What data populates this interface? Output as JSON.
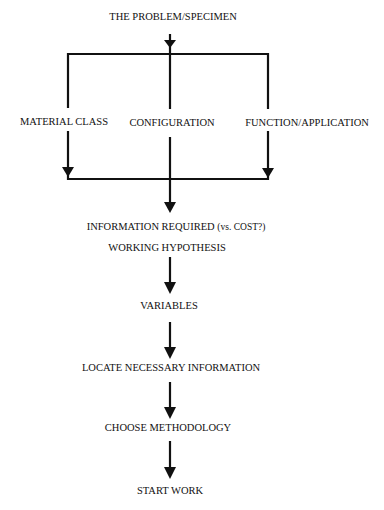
{
  "diagram": {
    "type": "flowchart",
    "colors": {
      "background": "#ffffff",
      "line": "#111111",
      "text": "#111111"
    },
    "nodes": [
      {
        "id": "problem",
        "label": "THE PROBLEM/SPECIMEN"
      },
      {
        "id": "material",
        "label": "MATERIAL CLASS"
      },
      {
        "id": "configuration",
        "label": "CONFIGURATION"
      },
      {
        "id": "function",
        "label": "FUNCTION/APPLICATION"
      },
      {
        "id": "info",
        "label": "INFORMATION REQUIRED",
        "note": "(vs. COST?)"
      },
      {
        "id": "hypothesis",
        "label": "WORKING HYPOTHESIS"
      },
      {
        "id": "variables",
        "label": "VARIABLES"
      },
      {
        "id": "locate",
        "label": "LOCATE NECESSARY INFORMATION"
      },
      {
        "id": "methodology",
        "label": "CHOOSE METHODOLOGY"
      },
      {
        "id": "start",
        "label": "START WORK"
      }
    ],
    "edges": [
      {
        "from": "problem",
        "to": "material"
      },
      {
        "from": "problem",
        "to": "configuration"
      },
      {
        "from": "problem",
        "to": "function"
      },
      {
        "from": "material",
        "to": "info"
      },
      {
        "from": "configuration",
        "to": "info"
      },
      {
        "from": "function",
        "to": "info"
      },
      {
        "from": "hypothesis",
        "to": "variables"
      },
      {
        "from": "variables",
        "to": "locate"
      },
      {
        "from": "locate",
        "to": "methodology"
      },
      {
        "from": "methodology",
        "to": "start"
      }
    ]
  }
}
